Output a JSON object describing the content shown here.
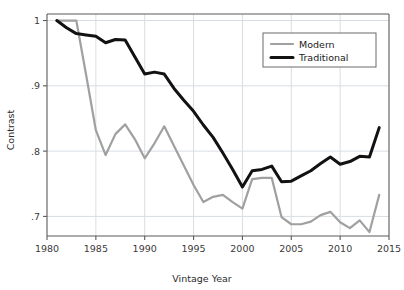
{
  "chart_data": {
    "type": "line",
    "title": "",
    "xlabel": "Vintage Year",
    "ylabel": "Contrast",
    "xlim": [
      1980,
      2015
    ],
    "ylim": [
      0.67,
      1.01
    ],
    "xticks": [
      1980,
      1985,
      1990,
      1995,
      2000,
      2005,
      2010,
      2015
    ],
    "xtick_labels": [
      "1980",
      "1985",
      "1990",
      "1995",
      "2000",
      "2005",
      "2010",
      "2015"
    ],
    "yticks": [
      0.7,
      0.8,
      0.9,
      1.0
    ],
    "ytick_labels": [
      ".7",
      ".8",
      ".9",
      "1"
    ],
    "grid": true,
    "grid_color": "#d8dde3",
    "legend_position": "top-right",
    "series": [
      {
        "name": "Modern",
        "color": "#a0a0a0",
        "width": 2.2,
        "x": [
          1981,
          1982,
          1983,
          1984,
          1985,
          1986,
          1987,
          1988,
          1989,
          1990,
          1991,
          1992,
          1993,
          1994,
          1995,
          1996,
          1997,
          1998,
          1999,
          2000,
          2001,
          2002,
          2003,
          2004,
          2005,
          2006,
          2007,
          2008,
          2009,
          2010,
          2011,
          2012,
          2013,
          2014
        ],
        "values": [
          1.0,
          1.0,
          1.0,
          0.917,
          0.832,
          0.794,
          0.826,
          0.841,
          0.818,
          0.789,
          0.812,
          0.838,
          0.808,
          0.778,
          0.748,
          0.722,
          0.73,
          0.733,
          0.722,
          0.712,
          0.757,
          0.759,
          0.759,
          0.699,
          0.688,
          0.688,
          0.692,
          0.702,
          0.707,
          0.691,
          0.682,
          0.694,
          0.676,
          0.733
        ]
      },
      {
        "name": "Traditional",
        "color": "#121212",
        "width": 3.0,
        "x": [
          1981,
          1982,
          1983,
          1984,
          1985,
          1986,
          1987,
          1988,
          1989,
          1990,
          1991,
          1992,
          1993,
          1994,
          1995,
          1996,
          1997,
          1998,
          1999,
          2000,
          2001,
          2002,
          2003,
          2004,
          2005,
          2006,
          2007,
          2008,
          2009,
          2010,
          2011,
          2012,
          2013,
          2014
        ],
        "values": [
          1.0,
          0.989,
          0.98,
          0.978,
          0.976,
          0.966,
          0.971,
          0.97,
          0.944,
          0.918,
          0.921,
          0.918,
          0.896,
          0.878,
          0.861,
          0.84,
          0.821,
          0.797,
          0.772,
          0.745,
          0.77,
          0.772,
          0.777,
          0.753,
          0.754,
          0.762,
          0.77,
          0.781,
          0.791,
          0.78,
          0.784,
          0.792,
          0.791,
          0.836
        ]
      }
    ]
  },
  "legend": {
    "entries": [
      {
        "label": "Modern"
      },
      {
        "label": "Traditional"
      }
    ]
  },
  "axes": {
    "x_title": "Vintage Year",
    "y_title": "Contrast"
  },
  "colors": {
    "modern": "#a0a0a0",
    "traditional": "#121212",
    "grid": "#d8dde3",
    "axis": "#5a5a5a",
    "background": "#ffffff"
  }
}
